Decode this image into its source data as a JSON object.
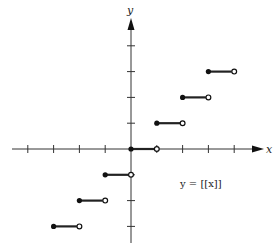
{
  "chart_data": {
    "type": "line",
    "title": "",
    "annotation": "y = [[x]]",
    "xlabel": "x",
    "ylabel": "y",
    "xlim": [
      -4,
      4
    ],
    "ylim": [
      -3,
      4
    ],
    "grid": false,
    "ticks_x": [
      -4,
      -3,
      -2,
      -1,
      1,
      2,
      3,
      4
    ],
    "ticks_y": [
      -3,
      -2,
      -1,
      1,
      2,
      3,
      4
    ],
    "segments": [
      {
        "x_start": -3,
        "x_end": -2,
        "y": -3,
        "closed_left": true,
        "open_right": true
      },
      {
        "x_start": -2,
        "x_end": -1,
        "y": -2,
        "closed_left": true,
        "open_right": true
      },
      {
        "x_start": -1,
        "x_end": 0,
        "y": -1,
        "closed_left": true,
        "open_right": true
      },
      {
        "x_start": 0,
        "x_end": 1,
        "y": 0,
        "closed_left": true,
        "open_right": true
      },
      {
        "x_start": 1,
        "x_end": 2,
        "y": 1,
        "closed_left": true,
        "open_right": true
      },
      {
        "x_start": 2,
        "x_end": 3,
        "y": 2,
        "closed_left": true,
        "open_right": true
      },
      {
        "x_start": 3,
        "x_end": 4,
        "y": 3,
        "closed_left": true,
        "open_right": true
      }
    ]
  },
  "labels": {
    "x_axis": "x",
    "y_axis": "y",
    "equation": "y = [[x]]"
  }
}
